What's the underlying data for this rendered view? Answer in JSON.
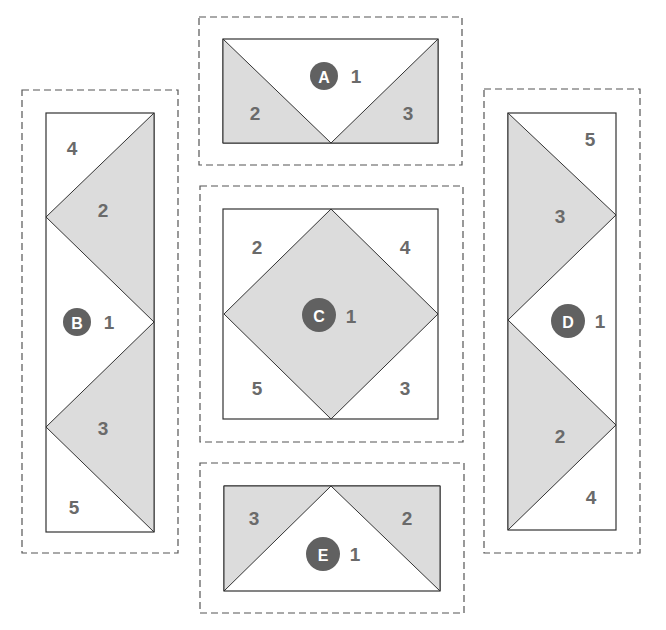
{
  "colors": {
    "shade": "#dcdcdc",
    "badge": "#616161",
    "number": "#6a6a6a",
    "line": "#333333"
  },
  "panels": {
    "A": {
      "badge": "A",
      "center_piece": "1",
      "left_piece": "2",
      "right_piece": "3"
    },
    "B": {
      "badge": "B",
      "center_piece": "1",
      "top_corner": "4",
      "upper_triangle": "2",
      "lower_triangle": "3",
      "bottom_corner": "5"
    },
    "C": {
      "badge": "C",
      "center_piece": "1",
      "top_left": "2",
      "top_right": "4",
      "bottom_right": "3",
      "bottom_left": "5"
    },
    "D": {
      "badge": "D",
      "center_piece": "1",
      "top_corner": "5",
      "upper_triangle": "3",
      "lower_triangle": "2",
      "bottom_corner": "4"
    },
    "E": {
      "badge": "E",
      "center_piece": "1",
      "left_piece": "3",
      "right_piece": "2"
    }
  }
}
